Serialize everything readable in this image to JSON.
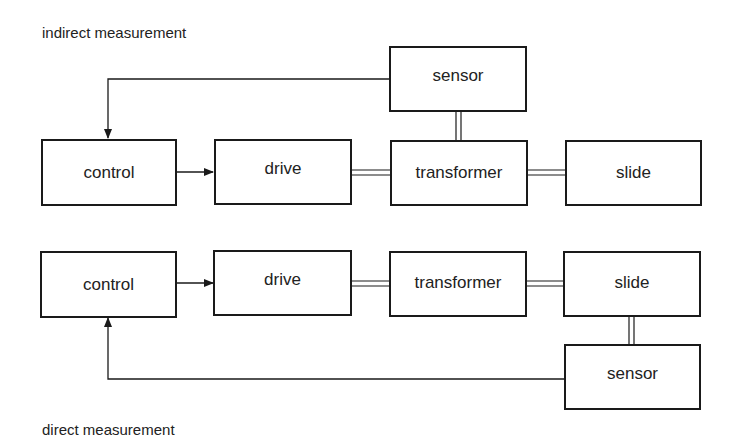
{
  "indirect": {
    "caption": "indirect measurement",
    "boxes": {
      "control": "control",
      "drive": "drive",
      "transformer": "transformer",
      "slide": "slide",
      "sensor": "sensor"
    }
  },
  "direct": {
    "caption": "direct measurement",
    "boxes": {
      "control": "control",
      "drive": "drive",
      "transformer": "transformer",
      "slide": "slide",
      "sensor": "sensor"
    }
  },
  "colors": {
    "line": "#1a1a1a",
    "background": "#ffffff",
    "text": "#222222"
  }
}
